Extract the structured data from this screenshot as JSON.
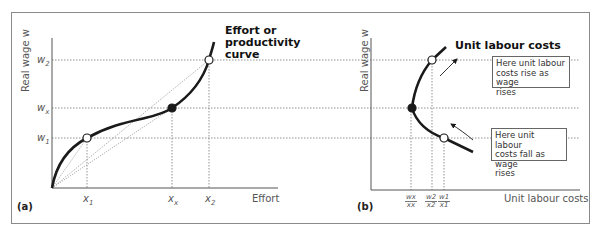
{
  "figure": {
    "panel_a": {
      "tag": "(a)",
      "y_axis_label": "Real wage w",
      "x_axis_label": "Effort",
      "curve_label": "Effort or productivity curve",
      "curve_label_lines": [
        "Effort or",
        "productivity",
        "curve"
      ],
      "y_ticks": [
        {
          "base": "w",
          "sub": "2"
        },
        {
          "base": "w",
          "sub": "x"
        },
        {
          "base": "w",
          "sub": "1"
        }
      ],
      "x_ticks": [
        {
          "base": "x",
          "sub": "1"
        },
        {
          "base": "x",
          "sub": "x"
        },
        {
          "base": "x",
          "sub": "2"
        }
      ]
    },
    "panel_b": {
      "tag": "(b)",
      "y_axis_label": "Real wage w",
      "x_axis_label": "Unit labour costs",
      "curve_label": "Unit labour costs",
      "note_top": "Here unit labour costs rise as wage rises",
      "note_top_lines": [
        "Here unit labour",
        "costs rise as wage",
        "rises"
      ],
      "note_bottom": "Here unit labour costs fall as wage rises",
      "note_bottom_lines": [
        "Here unit labour",
        "costs fall as wage",
        "rises"
      ],
      "x_ticks": [
        {
          "num": "wx",
          "den": "xx"
        },
        {
          "num": "w2",
          "den": "x2"
        },
        {
          "num": "w1",
          "den": "x1"
        }
      ]
    },
    "colors": {
      "curve": "#1a1a1a",
      "axis": "#555555",
      "guides": "#777777",
      "frame": "#8a8a8a"
    }
  }
}
